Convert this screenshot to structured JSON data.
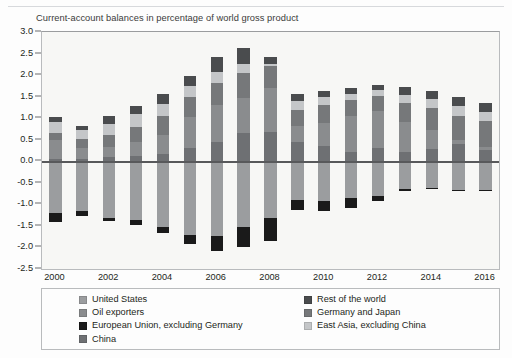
{
  "header": {
    "rule_present": true
  },
  "chart_data": {
    "type": "bar",
    "subtype": "stacked-bar-diverging",
    "title": "Current-account balances in percentage of world gross product",
    "xlabel": "",
    "ylabel": "",
    "ylim": [
      -2.5,
      3.0
    ],
    "ytick_step": 0.5,
    "yticks": [
      "3.0",
      "2.5",
      "2.0",
      "1.5",
      "1.0",
      "0.5",
      "0.0",
      "-0.5",
      "-1.0",
      "-1.5",
      "-2.0",
      "-2.5"
    ],
    "grid": false,
    "zero_line": true,
    "legend_position": "below-plot",
    "x": [
      2000,
      2001,
      2002,
      2003,
      2004,
      2005,
      2006,
      2007,
      2008,
      2009,
      2010,
      2011,
      2012,
      2013,
      2014,
      2015,
      2016
    ],
    "xtick_labels": [
      "2000",
      "2002",
      "2004",
      "2006",
      "2008",
      "2010",
      "2012",
      "2014",
      "2016"
    ],
    "xtick_values": [
      2000,
      2002,
      2004,
      2006,
      2008,
      2010,
      2012,
      2014,
      2016
    ],
    "series": [
      {
        "name": "China",
        "color": "#6e7073",
        "sign": "positive",
        "values": [
          0.06,
          0.05,
          0.1,
          0.12,
          0.16,
          0.3,
          0.45,
          0.66,
          0.69,
          0.44,
          0.36,
          0.22,
          0.3,
          0.21,
          0.29,
          0.4,
          0.26
        ]
      },
      {
        "name": "Oil exporters",
        "color": "#8a8c8e",
        "sign": "positive",
        "values": [
          0.44,
          0.26,
          0.22,
          0.32,
          0.44,
          0.72,
          0.86,
          0.8,
          1.02,
          0.37,
          0.52,
          0.82,
          0.86,
          0.7,
          0.43,
          0.1,
          0.08
        ]
      },
      {
        "name": "Germany and Japan",
        "color": "#76787a",
        "sign": "positive",
        "values": [
          0.16,
          0.2,
          0.28,
          0.36,
          0.44,
          0.46,
          0.5,
          0.58,
          0.5,
          0.38,
          0.42,
          0.38,
          0.36,
          0.44,
          0.52,
          0.56,
          0.6
        ]
      },
      {
        "name": "East Asia, excluding China",
        "color": "#c4c6c8",
        "sign": "positive",
        "values": [
          0.24,
          0.22,
          0.26,
          0.3,
          0.3,
          0.26,
          0.26,
          0.22,
          0.04,
          0.22,
          0.2,
          0.14,
          0.14,
          0.18,
          0.2,
          0.22,
          0.2
        ]
      },
      {
        "name": "Rest of the world",
        "color": "#4a4c4e",
        "sign": "positive",
        "values": [
          0.12,
          0.1,
          0.18,
          0.18,
          0.22,
          0.24,
          0.36,
          0.36,
          0.18,
          0.16,
          0.12,
          0.14,
          0.1,
          0.2,
          0.2,
          0.22,
          0.22
        ]
      },
      {
        "name": "United States",
        "color": "#9b9d9f",
        "sign": "negative",
        "values": [
          -1.21,
          -1.16,
          -1.31,
          -1.37,
          -1.52,
          -1.7,
          -1.74,
          -1.52,
          -1.32,
          -0.9,
          -0.93,
          -0.86,
          -0.8,
          -0.65,
          -0.62,
          -0.66,
          -0.66
        ]
      },
      {
        "name": "European Union, excluding Germany",
        "color": "#1a1a1a",
        "sign": "negative",
        "values": [
          -0.2,
          -0.1,
          -0.08,
          -0.1,
          -0.14,
          -0.22,
          -0.34,
          -0.46,
          -0.54,
          -0.24,
          -0.22,
          -0.22,
          -0.12,
          -0.04,
          -0.02,
          -0.02,
          -0.02
        ]
      }
    ],
    "stack_order_positive": [
      "China",
      "Oil exporters",
      "Germany and Japan",
      "East Asia, excluding China",
      "Rest of the world"
    ],
    "stack_order_negative": [
      "United States",
      "European Union, excluding Germany"
    ]
  },
  "legend": {
    "column_left": [
      {
        "label": "United States",
        "color": "#9b9d9f"
      },
      {
        "label": "Oil exporters",
        "color": "#8a8c8e"
      },
      {
        "label": "European Union, excluding Germany",
        "color": "#1a1a1a"
      },
      {
        "label": "China",
        "color": "#6e7073"
      }
    ],
    "column_right": [
      {
        "label": "Rest of the world",
        "color": "#4a4c4e"
      },
      {
        "label": "Germany and Japan",
        "color": "#76787a"
      },
      {
        "label": "East Asia, excluding China",
        "color": "#c4c6c8"
      }
    ]
  }
}
